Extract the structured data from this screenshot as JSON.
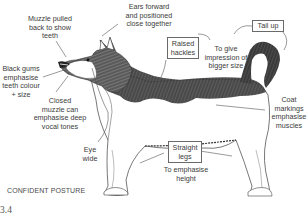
{
  "figure": {
    "caption": "CONFIDENT POSTURE",
    "number": "3.4"
  },
  "annotations": {
    "muzzle": "Muzzle pulled\nback to show\nteeth",
    "ears": "Ears forward\nand positioned\nclose together",
    "gums": "Black gums\nemphasise\nteeth colour\n+ size",
    "closed_muzzle": "Closed\nmuzzle can\nemphasise deep\nvocal tones",
    "eye": "Eye\nwide",
    "hackles_box": "Raised\nhackles",
    "tail_box": "Tail up",
    "bigger_size": "To give\nimpression of\nbigger size",
    "coat": "Coat\nmarkings\nemphasise\nmuscles",
    "legs_box": "Straight\nlegs",
    "height": "To emphasise\nheight"
  },
  "colors": {
    "ink": "#3b3b3b",
    "fur_dark": "#2a2a2a",
    "line": "#6a6a6a",
    "background": "#ffffff"
  }
}
